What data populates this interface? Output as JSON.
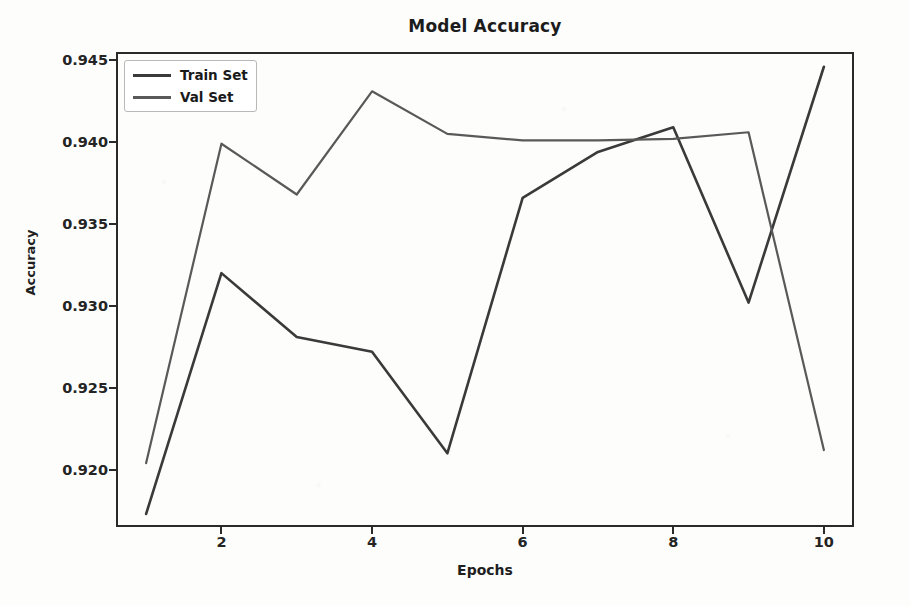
{
  "chart_data": {
    "type": "line",
    "title": "Model Accuracy",
    "xlabel": "Epochs",
    "ylabel": "Accuracy",
    "x": [
      1,
      2,
      3,
      4,
      5,
      6,
      7,
      8,
      9,
      10
    ],
    "xlim": [
      0.6,
      10.4
    ],
    "ylim": [
      0.9165,
      0.9455
    ],
    "grid": false,
    "legend_position": "upper left",
    "xticks": [
      "2",
      "4",
      "6",
      "8",
      "10"
    ],
    "xtick_values": [
      2,
      4,
      6,
      8,
      10
    ],
    "yticks": [
      "0.920",
      "0.925",
      "0.930",
      "0.935",
      "0.940",
      "0.945"
    ],
    "ytick_values": [
      0.92,
      0.925,
      0.93,
      0.935,
      0.94,
      0.945
    ],
    "series": [
      {
        "name": "Train Set",
        "color": "#3a3a3a",
        "values": [
          0.9173,
          0.932,
          0.9281,
          0.9272,
          0.921,
          0.9366,
          0.9394,
          0.9409,
          0.9302,
          0.9446
        ]
      },
      {
        "name": "Val Set",
        "color": "#595959",
        "values": [
          0.9204,
          0.9399,
          0.9368,
          0.9431,
          0.9405,
          0.9401,
          0.9401,
          0.9402,
          0.9406,
          0.9212
        ]
      }
    ]
  },
  "legend": {
    "items": [
      {
        "label": "Train Set"
      },
      {
        "label": "Val Set"
      }
    ]
  }
}
